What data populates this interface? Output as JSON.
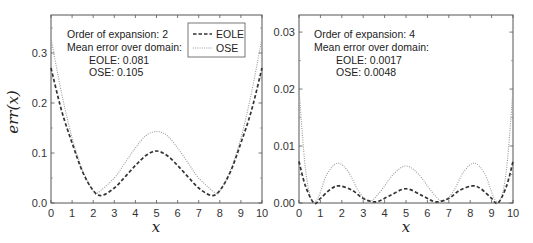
{
  "chart_data": [
    {
      "type": "line",
      "panel": "left",
      "xlabel": "x",
      "ylabel": "err(x)",
      "xlim": [
        0,
        10
      ],
      "ylim": [
        0,
        0.376
      ],
      "xticks": [
        "0",
        "1",
        "2",
        "3",
        "4",
        "5",
        "6",
        "7",
        "8",
        "9",
        "10"
      ],
      "yticks": [
        "0.0",
        "0.1",
        "0.2",
        "0.3"
      ],
      "grid": false,
      "annotations": [
        "Order of expansion: 2",
        "Mean error over domain:",
        "EOLE: 0.081",
        "OSE: 0.105"
      ],
      "legend": {
        "position": "upper right",
        "entries": [
          "EOLE",
          "OSE"
        ]
      },
      "series": [
        {
          "name": "EOLE",
          "style": "dashed",
          "x": [
            0,
            0.5,
            1,
            1.5,
            2,
            2.4,
            3,
            3.5,
            4,
            4.5,
            5,
            5.5,
            6,
            6.5,
            7,
            7.6,
            8,
            8.5,
            9,
            9.5,
            10
          ],
          "y": [
            0.27,
            0.185,
            0.12,
            0.062,
            0.025,
            0.015,
            0.03,
            0.052,
            0.075,
            0.095,
            0.104,
            0.095,
            0.075,
            0.052,
            0.03,
            0.015,
            0.025,
            0.062,
            0.12,
            0.185,
            0.27
          ]
        },
        {
          "name": "OSE",
          "style": "dotted",
          "x": [
            0,
            0.5,
            1,
            1.5,
            2,
            2.2,
            3,
            3.5,
            4,
            4.5,
            5,
            5.5,
            6,
            6.5,
            7,
            7.8,
            8,
            8.5,
            9,
            9.5,
            10
          ],
          "y": [
            0.33,
            0.22,
            0.13,
            0.065,
            0.024,
            0.02,
            0.05,
            0.08,
            0.11,
            0.135,
            0.143,
            0.135,
            0.11,
            0.08,
            0.05,
            0.02,
            0.024,
            0.065,
            0.13,
            0.22,
            0.33
          ]
        }
      ]
    },
    {
      "type": "line",
      "panel": "right",
      "xlabel": "x",
      "ylabel": "",
      "xlim": [
        0,
        10
      ],
      "ylim": [
        0,
        0.033
      ],
      "xticks": [
        "0",
        "1",
        "2",
        "3",
        "4",
        "5",
        "6",
        "7",
        "8",
        "9",
        "10"
      ],
      "yticks": [
        "0.00",
        "0.01",
        "0.02",
        "0.03"
      ],
      "grid": false,
      "annotations": [
        "Order of expansion: 4",
        "Mean error over domain:",
        "EOLE: 0.0017",
        "OSE: 0.0048"
      ],
      "series": [
        {
          "name": "EOLE",
          "style": "dashed",
          "x": [
            0,
            0.3,
            0.7,
            1,
            1.5,
            1.9,
            2.5,
            3,
            3.6,
            4.2,
            5,
            5.8,
            6.4,
            7,
            7.5,
            8.1,
            8.5,
            9,
            9.3,
            9.7,
            10
          ],
          "y": [
            0.0073,
            0.003,
            0.0,
            0.0008,
            0.0025,
            0.003,
            0.0022,
            0.0008,
            0.0002,
            0.0012,
            0.0025,
            0.0012,
            0.0002,
            0.0008,
            0.0022,
            0.003,
            0.0025,
            0.0008,
            0.0,
            0.003,
            0.0073
          ]
        },
        {
          "name": "OSE",
          "style": "dotted",
          "x": [
            0,
            0.3,
            0.6,
            0.9,
            1.3,
            1.8,
            2.3,
            2.8,
            3.3,
            3.8,
            4.4,
            5,
            5.6,
            6.2,
            6.7,
            7.2,
            7.7,
            8.2,
            8.7,
            9.1,
            9.4,
            9.7,
            10
          ],
          "y": [
            0.02,
            0.006,
            0.0005,
            0.001,
            0.005,
            0.007,
            0.0055,
            0.002,
            0.0003,
            0.002,
            0.005,
            0.0065,
            0.005,
            0.002,
            0.0003,
            0.002,
            0.0055,
            0.007,
            0.005,
            0.001,
            0.0005,
            0.006,
            0.02
          ]
        }
      ]
    }
  ],
  "panels": {
    "left": {
      "ylabel": "err(x)",
      "xlabel": "x",
      "annot": [
        "Order of expansion: 2",
        "Mean error over domain:",
        "EOLE: 0.081",
        "OSE: 0.105"
      ],
      "legend": [
        "EOLE",
        "OSE"
      ]
    },
    "right": {
      "xlabel": "x",
      "annot": [
        "Order of expansion: 4",
        "Mean error over domain:",
        "EOLE: 0.0017",
        "OSE: 0.0048"
      ]
    }
  },
  "colors": {
    "frame": "#555555",
    "eole": "#333333",
    "ose": "#9a9a9a",
    "text": "#222222"
  }
}
